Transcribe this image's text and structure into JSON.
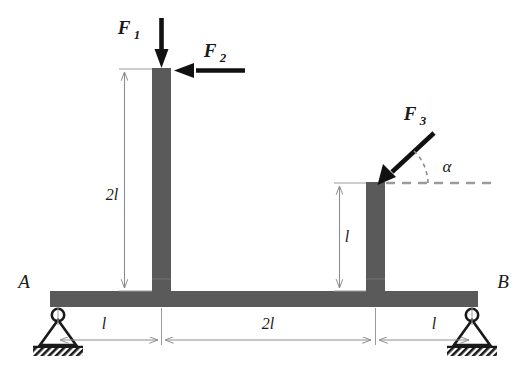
{
  "diagram": {
    "type": "structural-beam-free-body-diagram",
    "colors": {
      "member": "#5a5a5a",
      "member_edge": "#6e6e6e",
      "arrow": "#111111",
      "dimension_line": "#8d8d8d",
      "dashed_line": "#9a9a9a",
      "text": "#1a1a1a",
      "background": "#ffffff"
    },
    "forces": [
      {
        "id": "F1",
        "label": "F",
        "subscript": "1",
        "direction": "downward",
        "applied_at": "top of left column",
        "label_x": 128,
        "label_y": 28
      },
      {
        "id": "F2",
        "label": "F",
        "subscript": "2",
        "direction": "horizontal-leftward",
        "applied_at": "top of left column",
        "label_x": 213,
        "label_y": 57
      },
      {
        "id": "F3",
        "label": "F",
        "subscript": "3",
        "direction": "inclined down-left at angle alpha below horizontal",
        "applied_at": "top of right column",
        "label_x": 412,
        "label_y": 121
      }
    ],
    "angle": {
      "symbol": "α",
      "measured_from": "horizontal dashed line at top of right column",
      "label_x": 448,
      "label_y": 171
    },
    "supports": [
      {
        "id": "A",
        "label": "A",
        "kind": "pin-support",
        "position": "left end of beam",
        "label_x": 22,
        "label_y": 288
      },
      {
        "id": "B",
        "label": "B",
        "kind": "pin-support",
        "position": "right end of beam",
        "label_x": 500,
        "label_y": 288
      }
    ],
    "vertical_dimensions": [
      {
        "id": "left-column-height",
        "label": "2l",
        "label_x": 112,
        "label_y": 200,
        "member": "left column"
      },
      {
        "id": "right-column-height",
        "label": "l",
        "label_x": 347,
        "label_y": 242,
        "member": "right column"
      }
    ],
    "horizontal_dimensions": [
      {
        "id": "span-A-to-left-column",
        "label": "l",
        "label_x": 104,
        "label_y": 328
      },
      {
        "id": "span-left-column-to-right-column",
        "label": "2l",
        "label_x": 268,
        "label_y": 328
      },
      {
        "id": "span-right-column-to-B",
        "label": "l",
        "label_x": 434,
        "label_y": 328
      }
    ],
    "members": [
      {
        "id": "beam",
        "shape": "horizontal-rectangle"
      },
      {
        "id": "left-column",
        "shape": "vertical-rectangle"
      },
      {
        "id": "right-column",
        "shape": "vertical-rectangle"
      }
    ]
  }
}
